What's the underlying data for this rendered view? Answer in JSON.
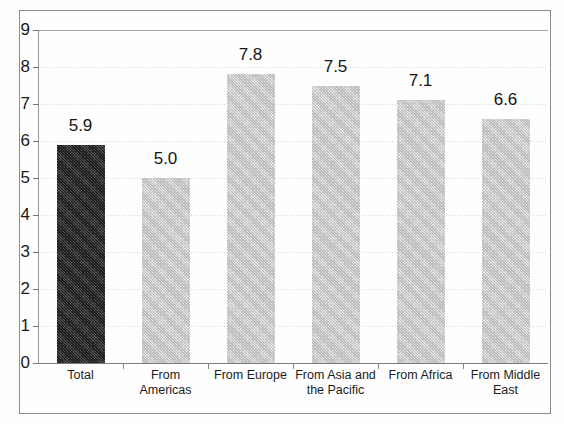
{
  "chart_data": {
    "type": "bar",
    "title": "",
    "xlabel": "",
    "ylabel": "",
    "ylim": [
      0,
      9
    ],
    "ytick_step": 1,
    "grid": true,
    "legend": "none",
    "categories": [
      "Total",
      "From Americas",
      "From Europe",
      "From Asia and the Pacific",
      "From Africa",
      "From Middle East"
    ],
    "category_lines": [
      [
        "Total"
      ],
      [
        "From",
        "Americas"
      ],
      [
        "From Europe"
      ],
      [
        "From Asia and",
        "the Pacific"
      ],
      [
        "From Africa"
      ],
      [
        "From Middle",
        "East"
      ]
    ],
    "values": [
      5.9,
      5.0,
      7.8,
      7.5,
      7.1,
      6.6
    ],
    "value_labels": [
      "5.9",
      "5.0",
      "7.8",
      "7.5",
      "7.1",
      "6.6"
    ],
    "bar_styles": [
      "dark",
      "light",
      "light",
      "light",
      "light",
      "light"
    ],
    "ytick_labels": [
      "9",
      "8",
      "7",
      "6",
      "5",
      "4",
      "3",
      "2",
      "1",
      "0"
    ]
  },
  "colors": {
    "bar_dark": "#3a3a3a",
    "bar_light": "#d2d2d2",
    "axis": "#7c7c7c",
    "grid": "#c9c9c9",
    "text": "#141414",
    "background": "#fdfdfb"
  }
}
